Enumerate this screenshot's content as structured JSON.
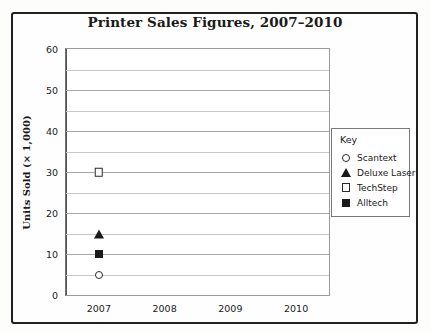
{
  "chart_data": {
    "type": "scatter",
    "title": "Printer Sales Figures, 2007–2010",
    "xlabel": "",
    "ylabel": "Units Sold (× 1,000)",
    "categories": [
      "2007",
      "2008",
      "2009",
      "2010"
    ],
    "ylim": [
      0,
      60
    ],
    "yticks": [
      0,
      10,
      20,
      30,
      40,
      50,
      60
    ],
    "ytick_labels": [
      "0",
      "10",
      "20",
      "30",
      "40",
      "50",
      "60"
    ],
    "minor_gridline_step": 5,
    "grid": true,
    "legend_position": "right",
    "legend_title": "Key",
    "series": [
      {
        "name": "Scantext",
        "marker": "circle-open",
        "points": [
          {
            "x": "2007",
            "y": 5
          }
        ]
      },
      {
        "name": "Deluxe Laser",
        "marker": "triangle-filled",
        "points": [
          {
            "x": "2007",
            "y": 15
          }
        ]
      },
      {
        "name": "TechStep",
        "marker": "square-open",
        "points": [
          {
            "x": "2007",
            "y": 30
          }
        ]
      },
      {
        "name": "Alltech",
        "marker": "square-filled",
        "points": [
          {
            "x": "2007",
            "y": 10
          }
        ]
      }
    ]
  }
}
